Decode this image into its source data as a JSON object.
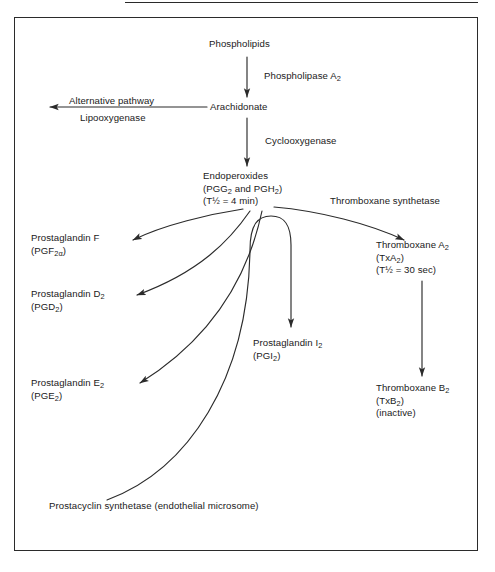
{
  "figure": {
    "background_color": "#ffffff",
    "line_color": "#2b2b2b",
    "text_color": "#1a1a1a"
  },
  "nodes": {
    "phospholipids": {
      "line1": "Phospholipids"
    },
    "arachidonate": {
      "line1": "Arachidonate"
    },
    "endoperoxides": {
      "line1": "Endoperoxides",
      "line2_a": "(PGG",
      "line2_b": "2",
      "line2_c": " and PGH",
      "line2_d": "2",
      "line2_e": ")",
      "line3_a": "(T",
      "line3_b": "½",
      "line3_c": " = 4 min)"
    },
    "prostaglandin_f": {
      "line1": "Prostaglandin F",
      "line2_a": "(PGF",
      "line2_b": "2α",
      "line2_c": ")"
    },
    "prostaglandin_d": {
      "line1_a": "Prostaglandin D",
      "line1_b": "2",
      "line2_a": "(PGD",
      "line2_b": "2",
      "line2_c": ")"
    },
    "prostaglandin_e": {
      "line1_a": "Prostaglandin E",
      "line1_b": "2",
      "line2_a": "(PGE",
      "line2_b": "2",
      "line2_c": ")"
    },
    "prostaglandin_i": {
      "line1_a": "Prostaglandin I",
      "line1_b": "2",
      "line2_a": "(PGI",
      "line2_b": "2",
      "line2_c": ")"
    },
    "thromboxane_a": {
      "line1_a": "Thromboxane A",
      "line1_b": "2",
      "line2_a": "(TxA",
      "line2_b": "2",
      "line2_c": ")",
      "line3_a": "(T",
      "line3_b": "½",
      "line3_c": " = 30 sec)"
    },
    "thromboxane_b": {
      "line1_a": "Thromboxane B",
      "line1_b": "2",
      "line2_a": "(TxB",
      "line2_b": "2",
      "line2_c": ")",
      "line3": "(inactive)"
    }
  },
  "enzymes": {
    "phospholipase_a2": {
      "text_a": "Phospholipase A",
      "text_b": "2"
    },
    "alternative_pathway": {
      "text": "Alternative pathway"
    },
    "lipooxygenase": {
      "text": "Lipooxygenase"
    },
    "cyclooxygenase": {
      "text": "Cyclooxygenase"
    },
    "thromboxane_synthetase": {
      "text": "Thromboxane synthetase"
    },
    "prostacyclin_synthetase": {
      "line1": "Prostacyclin synthetase",
      "line2": "(endothelial microsome)"
    }
  }
}
